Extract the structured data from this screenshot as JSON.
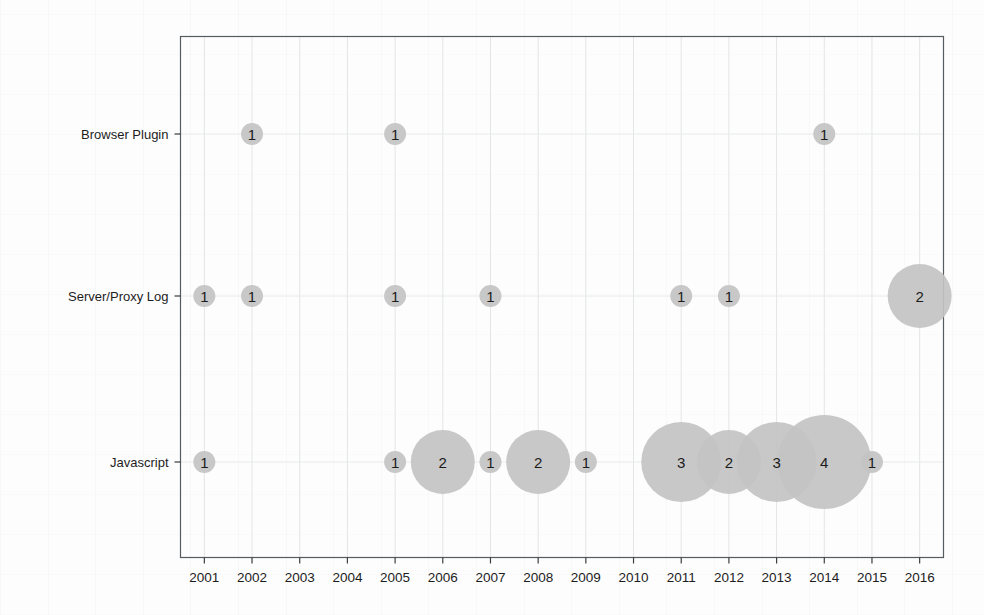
{
  "chart_data": {
    "type": "scatter",
    "variant": "bubble-matrix",
    "title": "",
    "subtitle": "",
    "xlabel": "",
    "ylabel": "",
    "grid": true,
    "legend": false,
    "legend_position": "none",
    "bubble_color": "#c3c3c3",
    "label_color": "#1c1c1c",
    "axis_color": "#555b5e",
    "categories": [
      "2001",
      "2002",
      "2003",
      "2004",
      "2005",
      "2006",
      "2007",
      "2008",
      "2009",
      "2010",
      "2011",
      "2012",
      "2013",
      "2014",
      "2015",
      "2016"
    ],
    "x": [
      2001,
      2002,
      2003,
      2004,
      2005,
      2006,
      2007,
      2008,
      2009,
      2010,
      2011,
      2012,
      2013,
      2014,
      2015,
      2016
    ],
    "xlim": [
      2000.5,
      2016.5
    ],
    "y_categories": [
      "Javascript",
      "Server/Proxy Log",
      "Browser Plugin"
    ],
    "ylim": [
      0,
      4
    ],
    "value_range": [
      1,
      4
    ],
    "series": [
      {
        "name": "Browser Plugin",
        "row": 2,
        "points": [
          {
            "x": 2002,
            "value": 1
          },
          {
            "x": 2005,
            "value": 1
          },
          {
            "x": 2014,
            "value": 1
          }
        ]
      },
      {
        "name": "Server/Proxy Log",
        "row": 1,
        "points": [
          {
            "x": 2001,
            "value": 1
          },
          {
            "x": 2002,
            "value": 1
          },
          {
            "x": 2005,
            "value": 1
          },
          {
            "x": 2007,
            "value": 1
          },
          {
            "x": 2011,
            "value": 1
          },
          {
            "x": 2012,
            "value": 1
          },
          {
            "x": 2016,
            "value": 2
          }
        ]
      },
      {
        "name": "Javascript",
        "row": 0,
        "points": [
          {
            "x": 2001,
            "value": 1
          },
          {
            "x": 2005,
            "value": 1
          },
          {
            "x": 2006,
            "value": 2
          },
          {
            "x": 2007,
            "value": 1
          },
          {
            "x": 2008,
            "value": 2
          },
          {
            "x": 2009,
            "value": 1
          },
          {
            "x": 2011,
            "value": 3
          },
          {
            "x": 2012,
            "value": 2
          },
          {
            "x": 2013,
            "value": 3
          },
          {
            "x": 2014,
            "value": 4
          },
          {
            "x": 2015,
            "value": 1
          }
        ]
      }
    ]
  }
}
